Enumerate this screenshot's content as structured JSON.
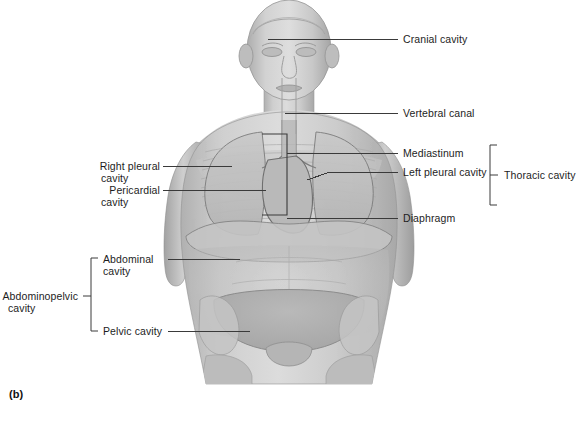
{
  "figure": {
    "panel_letter": "(b)",
    "view": "anterior",
    "line_color": "#3a3a3a",
    "body_fill_light": "#d2d2d2",
    "body_fill_mid": "#bdbdbd",
    "body_fill_dark": "#a6a6a6",
    "background": "#ffffff"
  },
  "labels": {
    "cranial_cavity": "Cranial cavity",
    "vertebral_canal": "Vertebral canal",
    "mediastinum": "Mediastinum",
    "left_pleural_cavity": "Left pleural cavity",
    "diaphragm": "Diaphragm",
    "thoracic_cavity": "Thoracic cavity",
    "right_pleural_cavity_line1": "Right pleural",
    "right_pleural_cavity_line2": "cavity",
    "pericardial_cavity_line1": "Pericardial",
    "pericardial_cavity_line2": "cavity",
    "abdominal_cavity_line1": "Abdominal",
    "abdominal_cavity_line2": "cavity",
    "pelvic_cavity": "Pelvic cavity",
    "abdominopelvic_cavity_line1": "Abdominopelvic",
    "abdominopelvic_cavity_line2": "cavity"
  }
}
